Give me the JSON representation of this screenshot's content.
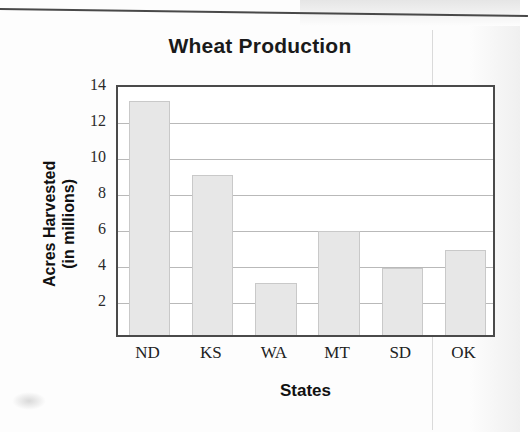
{
  "chart_data": {
    "type": "bar",
    "title": "Wheat Production",
    "xlabel": "States",
    "ylabel": "Acres Harvested (in millions)",
    "ylabel_lines": [
      "Acres Harvested",
      "(in millions)"
    ],
    "categories": [
      "ND",
      "KS",
      "WA",
      "MT",
      "SD",
      "OK"
    ],
    "values": [
      13.0,
      8.9,
      2.9,
      5.8,
      3.75,
      4.7
    ],
    "ylim": [
      0,
      14
    ],
    "yticks": [
      2,
      4,
      6,
      8,
      10,
      12,
      14
    ],
    "ytick_labels": [
      "2",
      "4",
      "6",
      "8",
      "10",
      "12",
      "14"
    ],
    "grid": true,
    "grid_axis": "y",
    "legend": false,
    "bar_color": "#e7e7e7",
    "bar_edge_color": "#c9c9c9",
    "axis_color": "#4a4a4a",
    "grid_color": "#b9b9b9"
  }
}
